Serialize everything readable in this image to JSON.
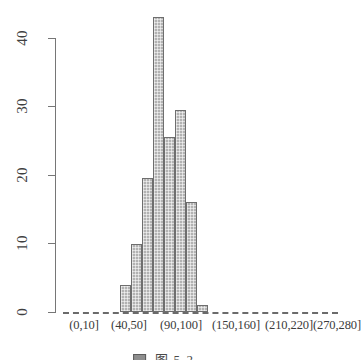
{
  "chart_data": {
    "type": "bar",
    "title": "",
    "subtitle": "",
    "xlabel": "",
    "ylabel": "",
    "grid": false,
    "legend": "none",
    "ylim": [
      0,
      44
    ],
    "yticks": [
      0,
      10,
      20,
      30,
      40
    ],
    "ytick_labels": [
      "0",
      "10",
      "20",
      "30",
      "40"
    ],
    "xtick_labels": [
      "(0,10]",
      "(40,50]",
      "(90,100]",
      "(150,160]",
      "(210,220]",
      "(270,280]"
    ],
    "bin_width": 10,
    "categories": [
      "(50,60]",
      "(60,70]",
      "(70,80]",
      "(80,90]",
      "(90,100]",
      "(100,110]",
      "(110,120]",
      "(120,130]",
      "(130,140]"
    ],
    "values": [
      4,
      10,
      19.5,
      43,
      25.5,
      29.5,
      16,
      1,
      0
    ],
    "bar_fill_color": "#b2b2b2",
    "bar_border_color": "#6e6e6e",
    "axis_color": "#767676",
    "baseline_style": "dashed"
  },
  "axis": {
    "y_ticks": [
      {
        "label": "40",
        "value": 40
      },
      {
        "label": "30",
        "value": 30
      },
      {
        "label": "20",
        "value": 20
      },
      {
        "label": "10",
        "value": 10
      },
      {
        "label": "0",
        "value": 0
      }
    ],
    "x_ticks": [
      {
        "label": "(0,10]",
        "x": 84
      },
      {
        "label": "(40,50]",
        "x": 129
      },
      {
        "label": "(90,100]",
        "x": 181
      },
      {
        "label": "(150,160]",
        "x": 236
      },
      {
        "label": "(210,220]",
        "x": 289
      },
      {
        "label": "(270,280]",
        "x": 337
      }
    ]
  },
  "bars": [
    {
      "label": "(50,60]",
      "value": 4,
      "x": 120,
      "width": 11
    },
    {
      "label": "(60,70]",
      "value": 10,
      "x": 131,
      "width": 11
    },
    {
      "label": "(70,80]",
      "value": 19.5,
      "x": 142,
      "width": 11
    },
    {
      "label": "(80,90]",
      "value": 43,
      "x": 153,
      "width": 11
    },
    {
      "label": "(90,100]",
      "value": 25.5,
      "x": 164,
      "width": 11
    },
    {
      "label": "(100,110]",
      "value": 29.5,
      "x": 175,
      "width": 11
    },
    {
      "label": "(110,120]",
      "value": 16,
      "x": 186,
      "width": 11
    },
    {
      "label": "(120,130]",
      "value": 1,
      "x": 197,
      "width": 11
    }
  ],
  "caption": {
    "text": "图 5-2  ..."
  }
}
